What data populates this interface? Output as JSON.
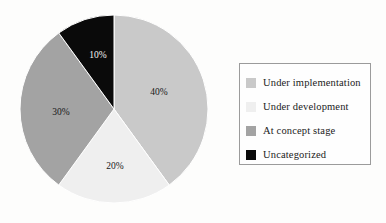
{
  "chart_data": {
    "type": "pie",
    "title": "",
    "subtitle": "",
    "xlabel": "",
    "ylabel": "",
    "grid": false,
    "legend_position": "right",
    "categories": [
      "Under implementation",
      "Under development",
      "At concept stage",
      "Uncategorized"
    ],
    "values": [
      40,
      20,
      30,
      10
    ],
    "value_labels": [
      "40%",
      "20%",
      "30%",
      "10%"
    ],
    "colors": [
      "#c9c9c9",
      "#efefef",
      "#a3a3a3",
      "#0a0a0a"
    ],
    "label_colors": [
      "#181818",
      "#181818",
      "#181818",
      "#f4f4f4"
    ],
    "start_angle_deg": 0,
    "direction": "clockwise",
    "units": "percent"
  },
  "pie": {
    "center_x": 95,
    "center_y": 95,
    "radius": 94,
    "slices": [
      {
        "name": "Under implementation",
        "label": "40%",
        "value": 40,
        "color": "#c9c9c9",
        "label_x": 140,
        "label_y": 79,
        "dark": false
      },
      {
        "name": "Under development",
        "label": "20%",
        "value": 20,
        "color": "#efefef",
        "label_x": 96,
        "label_y": 153,
        "dark": false
      },
      {
        "name": "At concept stage",
        "label": "30%",
        "value": 30,
        "color": "#a3a3a3",
        "label_x": 42,
        "label_y": 99,
        "dark": false
      },
      {
        "name": "Uncategorized",
        "label": "10%",
        "value": 10,
        "color": "#0a0a0a",
        "label_x": 79,
        "label_y": 42,
        "dark": true
      }
    ]
  },
  "legend": {
    "border_color": "#9b9b9b",
    "items": [
      {
        "label": "Under implementation",
        "color": "#c9c9c9"
      },
      {
        "label": "Under development",
        "color": "#efefef"
      },
      {
        "label": "At concept stage",
        "color": "#a3a3a3"
      },
      {
        "label": "Uncategorized",
        "color": "#0a0a0a"
      }
    ]
  }
}
